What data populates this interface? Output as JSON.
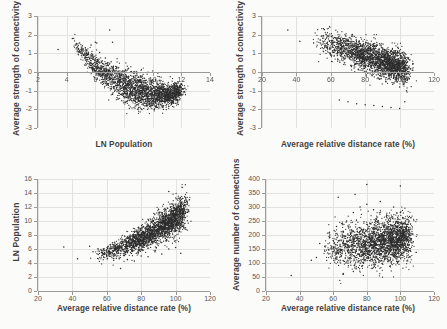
{
  "figure": {
    "background": "#fbfbfa",
    "point_color": "#2b2b2b",
    "grid_color": "#e2e2e2",
    "axis_color": "#9a9a9a",
    "panels": 4
  },
  "chart_data": [
    {
      "id": "top-left",
      "type": "scatter",
      "title": "",
      "xlabel": "LN Population",
      "ylabel": "Average strength of connectivity",
      "xlim": [
        2,
        14
      ],
      "ylim": [
        -3,
        3
      ],
      "xticks": [
        2,
        4,
        6,
        8,
        10,
        12,
        14
      ],
      "yticks": [
        -3,
        -2,
        -1,
        0,
        1,
        2,
        3
      ],
      "grid": true,
      "legend": "none",
      "n_points": 2400,
      "relationship": "strong negative curvilinear (U-shaped minimum near LN Population 9.5)",
      "x_range_data": [
        3.3,
        12.4
      ],
      "y_range_data": [
        -2.0,
        2.3
      ],
      "points": [
        [
          3.4,
          1.2
        ],
        [
          4.4,
          1.8
        ],
        [
          4.6,
          1.45
        ],
        [
          4.9,
          1.55
        ],
        [
          5.0,
          1.1
        ],
        [
          5.2,
          0.9
        ],
        [
          5.3,
          1.3
        ],
        [
          5.4,
          0.55
        ],
        [
          5.5,
          1.0
        ],
        [
          5.6,
          0.7
        ],
        [
          5.7,
          1.45
        ],
        [
          5.8,
          0.4
        ],
        [
          5.9,
          0.85
        ],
        [
          6.0,
          1.6
        ],
        [
          6.1,
          0.2
        ],
        [
          6.2,
          0.6
        ],
        [
          6.3,
          1.05
        ],
        [
          6.4,
          0.15
        ],
        [
          6.5,
          0.45
        ],
        [
          6.6,
          -0.1
        ],
        [
          6.7,
          0.75
        ],
        [
          6.8,
          0.0
        ],
        [
          6.9,
          0.35
        ],
        [
          7.0,
          -0.25
        ],
        [
          7.1,
          0.55
        ],
        [
          7.2,
          -0.4
        ],
        [
          7.3,
          0.1
        ],
        [
          7.4,
          -0.55
        ],
        [
          7.5,
          0.25
        ],
        [
          7.6,
          -0.7
        ],
        [
          7.7,
          -0.15
        ],
        [
          7.8,
          -0.8
        ],
        [
          7.9,
          0.05
        ],
        [
          8.0,
          -0.95
        ],
        [
          8.1,
          -0.35
        ],
        [
          8.2,
          -1.05
        ],
        [
          8.3,
          -0.5
        ],
        [
          8.4,
          -1.15
        ],
        [
          8.5,
          -0.65
        ],
        [
          8.6,
          -1.25
        ],
        [
          8.7,
          -0.85
        ],
        [
          8.8,
          -1.35
        ],
        [
          8.9,
          -1.0
        ],
        [
          9.0,
          -1.45
        ],
        [
          9.1,
          -1.15
        ],
        [
          9.2,
          -1.55
        ],
        [
          9.3,
          -1.3
        ],
        [
          9.4,
          -1.62
        ],
        [
          9.5,
          -1.45
        ],
        [
          9.6,
          -1.7
        ],
        [
          9.7,
          -1.55
        ],
        [
          9.8,
          -1.75
        ],
        [
          9.9,
          -1.6
        ],
        [
          10.0,
          -1.8
        ],
        [
          10.2,
          -1.65
        ],
        [
          10.4,
          -1.72
        ],
        [
          10.6,
          -1.55
        ],
        [
          10.8,
          -1.6
        ],
        [
          11.0,
          -1.45
        ],
        [
          11.2,
          -1.5
        ],
        [
          11.4,
          -1.3
        ],
        [
          11.6,
          -1.35
        ],
        [
          11.8,
          -1.15
        ],
        [
          12.0,
          -1.2
        ],
        [
          12.2,
          -1.05
        ],
        [
          7.0,
          2.25
        ],
        [
          7.2,
          1.6
        ],
        [
          6.1,
          1.55
        ],
        [
          5.1,
          1.4
        ]
      ]
    },
    {
      "id": "top-right",
      "type": "scatter",
      "title": "",
      "xlabel": "Average relative distance rate (%)",
      "ylabel": "Average strength of connectivity",
      "xlim": [
        20,
        120
      ],
      "ylim": [
        -3,
        3
      ],
      "xticks": [
        20,
        40,
        60,
        80,
        100,
        120
      ],
      "yticks": [
        -3,
        -2,
        -1,
        0,
        1,
        2,
        3
      ],
      "grid": true,
      "legend": "none",
      "n_points": 2400,
      "relationship": "negative linear",
      "x_range_data": [
        34,
        105
      ],
      "y_range_data": [
        -2.0,
        2.25
      ],
      "points": [
        [
          35,
          2.25
        ],
        [
          42,
          1.65
        ],
        [
          50,
          1.55
        ],
        [
          55,
          1.3
        ],
        [
          58,
          1.6
        ],
        [
          60,
          0.9
        ],
        [
          62,
          1.2
        ],
        [
          64,
          0.7
        ],
        [
          66,
          1.0
        ],
        [
          68,
          0.5
        ],
        [
          70,
          0.8
        ],
        [
          72,
          0.3
        ],
        [
          74,
          0.6
        ],
        [
          76,
          0.15
        ],
        [
          78,
          0.45
        ],
        [
          80,
          0.0
        ],
        [
          82,
          0.3
        ],
        [
          84,
          -0.2
        ],
        [
          86,
          0.1
        ],
        [
          88,
          -0.35
        ],
        [
          90,
          -0.05
        ],
        [
          92,
          -0.5
        ],
        [
          94,
          -0.2
        ],
        [
          96,
          -0.65
        ],
        [
          98,
          -0.35
        ],
        [
          100,
          -0.8
        ],
        [
          102,
          -0.55
        ],
        [
          104,
          -1.0
        ],
        [
          75,
          1.55
        ],
        [
          85,
          1.4
        ],
        [
          65,
          -1.5
        ],
        [
          70,
          -1.6
        ],
        [
          75,
          -1.7
        ],
        [
          80,
          -1.75
        ],
        [
          85,
          -1.8
        ],
        [
          90,
          -1.85
        ],
        [
          95,
          -1.9
        ],
        [
          100,
          -1.95
        ],
        [
          103,
          -1.6
        ]
      ]
    },
    {
      "id": "bottom-left",
      "type": "scatter",
      "title": "",
      "xlabel": "Average relative distance rate (%)",
      "ylabel": "LN Population",
      "xlim": [
        20,
        120
      ],
      "ylim": [
        0,
        16
      ],
      "xticks": [
        20,
        40,
        60,
        80,
        100,
        120
      ],
      "yticks": [
        0,
        2,
        4,
        6,
        8,
        10,
        12,
        14,
        16
      ],
      "grid": true,
      "legend": "none",
      "n_points": 2400,
      "relationship": "positive, fan-shaped widening toward high distance rate",
      "x_range_data": [
        35,
        106
      ],
      "y_range_data": [
        3.2,
        14.2
      ],
      "points": [
        [
          35,
          6.3
        ],
        [
          43,
          4.6
        ],
        [
          50,
          6.4
        ],
        [
          52,
          5.6
        ],
        [
          55,
          5.2
        ],
        [
          58,
          6.0
        ],
        [
          60,
          5.0
        ],
        [
          62,
          6.6
        ],
        [
          64,
          4.4
        ],
        [
          66,
          6.2
        ],
        [
          68,
          3.2
        ],
        [
          70,
          7.0
        ],
        [
          72,
          4.5
        ],
        [
          74,
          6.8
        ],
        [
          76,
          4.3
        ],
        [
          78,
          7.4
        ],
        [
          80,
          5.0
        ],
        [
          82,
          7.8
        ],
        [
          84,
          4.9
        ],
        [
          86,
          8.2
        ],
        [
          88,
          5.6
        ],
        [
          90,
          8.8
        ],
        [
          92,
          5.3
        ],
        [
          94,
          9.4
        ],
        [
          96,
          14.2
        ],
        [
          97,
          12.0
        ],
        [
          98,
          10.5
        ],
        [
          100,
          11.2
        ],
        [
          102,
          10.0
        ],
        [
          104,
          11.6
        ],
        [
          105,
          9.0
        ],
        [
          103,
          5.4
        ],
        [
          100,
          6.2
        ],
        [
          96,
          6.0
        ]
      ]
    },
    {
      "id": "bottom-right",
      "type": "scatter",
      "title": "",
      "xlabel": "Average relative distance rate (%)",
      "ylabel": "Average number of connections",
      "xlim": [
        20,
        120
      ],
      "ylim": [
        0,
        400
      ],
      "xticks": [
        20,
        40,
        60,
        80,
        100,
        120
      ],
      "yticks": [
        0,
        50,
        100,
        150,
        200,
        250,
        300,
        350,
        400
      ],
      "grid": true,
      "legend": "none",
      "n_points": 2400,
      "relationship": "weak positive, broad diffuse cloud centered near 200",
      "x_range_data": [
        35,
        106
      ],
      "y_range_data": [
        50,
        380
      ],
      "points": [
        [
          35,
          55
        ],
        [
          47,
          110
        ],
        [
          50,
          120
        ],
        [
          52,
          170
        ],
        [
          55,
          160
        ],
        [
          58,
          200
        ],
        [
          60,
          180
        ],
        [
          62,
          230
        ],
        [
          64,
          150
        ],
        [
          66,
          210
        ],
        [
          68,
          250
        ],
        [
          70,
          190
        ],
        [
          72,
          280
        ],
        [
          74,
          170
        ],
        [
          76,
          300
        ],
        [
          78,
          220
        ],
        [
          80,
          310
        ],
        [
          80,
          380
        ],
        [
          82,
          240
        ],
        [
          84,
          290
        ],
        [
          86,
          200
        ],
        [
          88,
          320
        ],
        [
          90,
          230
        ],
        [
          92,
          270
        ],
        [
          94,
          250
        ],
        [
          96,
          300
        ],
        [
          98,
          210
        ],
        [
          100,
          280
        ],
        [
          102,
          240
        ],
        [
          104,
          230
        ],
        [
          63,
          335
        ],
        [
          73,
          345
        ],
        [
          100,
          375
        ],
        [
          66,
          60
        ],
        [
          72,
          70
        ],
        [
          78,
          100
        ]
      ]
    }
  ],
  "panels": {
    "top_left": {
      "ylabel": "Average strength of connectivity",
      "xlabel": "LN Population",
      "yticklabels": [
        "3",
        "2",
        "1",
        "0",
        "-1",
        "-2",
        "-3"
      ],
      "xticklabels": [
        "2",
        "4",
        "6",
        "8",
        "10",
        "12",
        "14"
      ]
    },
    "top_right": {
      "ylabel": "Average strength of connectivity",
      "xlabel": "Average relative distance rate (%)",
      "yticklabels": [
        "3",
        "2",
        "1",
        "0",
        "-1",
        "-2",
        "-3"
      ],
      "xticklabels": [
        "20",
        "40",
        "60",
        "80",
        "100",
        "120"
      ]
    },
    "bottom_left": {
      "ylabel": "LN Population",
      "xlabel": "Average relative distance rate (%)",
      "yticklabels": [
        "16",
        "14",
        "12",
        "10",
        "8",
        "6",
        "4",
        "2",
        "0"
      ],
      "xticklabels": [
        "20",
        "40",
        "60",
        "80",
        "100",
        "120"
      ]
    },
    "bottom_right": {
      "ylabel": "Average number of connections",
      "xlabel": "Average relative distance rate (%)",
      "yticklabels": [
        "400",
        "350",
        "300",
        "250",
        "200",
        "150",
        "100",
        "50",
        "0"
      ],
      "xticklabels": [
        "20",
        "40",
        "60",
        "80",
        "100",
        "120"
      ]
    }
  }
}
